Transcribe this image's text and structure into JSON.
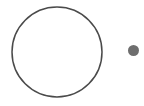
{
  "canvas": {
    "width": 144,
    "height": 106,
    "background_color": "#ffffff"
  },
  "shapes": {
    "large_circle": {
      "label": "large-outline-circle",
      "center_x": 57,
      "center_y": 52,
      "radius": 45,
      "fill": "none",
      "stroke_color": "#4a4a4a",
      "stroke_width": 1.5
    },
    "small_dot": {
      "label": "small-filled-dot",
      "center_x": 133.5,
      "center_y": 50.5,
      "radius": 5.5,
      "fill_color": "#6e6e6e",
      "stroke_color": "none",
      "stroke_width": 0
    }
  }
}
